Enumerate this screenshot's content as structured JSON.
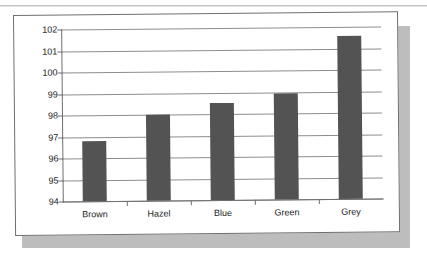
{
  "chart_data": {
    "type": "bar",
    "title": "",
    "subtitle": "",
    "xlabel": "",
    "ylabel": "",
    "categories": [
      "Brown",
      "Hazel",
      "Blue",
      "Green",
      "Grey"
    ],
    "values": [
      96.8,
      98.0,
      98.5,
      98.95,
      101.6
    ],
    "ylim": [
      94,
      102
    ],
    "yticks": [
      94,
      95,
      96,
      97,
      98,
      99,
      100,
      101,
      102
    ],
    "ytick_labels": [
      "94",
      "95",
      "96",
      "97",
      "98",
      "99",
      "100",
      "101",
      "102"
    ],
    "grid": true,
    "legend": false,
    "legend_position": "none",
    "series": [
      {
        "name": "",
        "values": [
          96.8,
          98.0,
          98.5,
          98.95,
          101.6
        ]
      }
    ],
    "colors": {
      "bar_fill": "#535353",
      "gridline": "#8d8d8d",
      "axis": "#6f6f6f",
      "panel_background": "#ffffff",
      "panel_shadow": "#bdbdbd",
      "page_background": "#ffffff",
      "text": "#1a1a1a"
    }
  }
}
